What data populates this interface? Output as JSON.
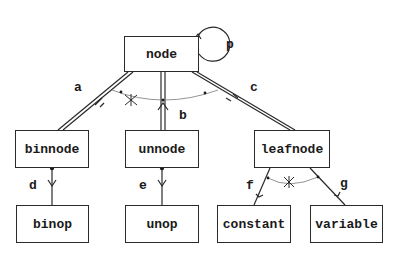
{
  "diagram": {
    "type": "entity-relationship / class hierarchy",
    "nodes": [
      {
        "id": "node",
        "label": "node"
      },
      {
        "id": "binnode",
        "label": "binnode"
      },
      {
        "id": "unnode",
        "label": "unnode"
      },
      {
        "id": "leafnode",
        "label": "leafnode"
      },
      {
        "id": "binop",
        "label": "binop"
      },
      {
        "id": "unop",
        "label": "unop"
      },
      {
        "id": "constant",
        "label": "constant"
      },
      {
        "id": "variable",
        "label": "variable"
      }
    ],
    "edges": [
      {
        "label": "a",
        "from": "node",
        "to": "binnode",
        "style": "double"
      },
      {
        "label": "b",
        "from": "node",
        "to": "unnode",
        "style": "double"
      },
      {
        "label": "c",
        "from": "node",
        "to": "leafnode",
        "style": "double"
      },
      {
        "label": "d",
        "from": "binnode",
        "to": "binop",
        "style": "single"
      },
      {
        "label": "e",
        "from": "unnode",
        "to": "unop",
        "style": "single"
      },
      {
        "label": "f",
        "from": "leafnode",
        "to": "constant",
        "style": "single"
      },
      {
        "label": "g",
        "from": "leafnode",
        "to": "variable",
        "style": "single"
      },
      {
        "label": "p",
        "from": "node",
        "to": "node",
        "style": "self-loop"
      }
    ],
    "exclusive_arcs": [
      {
        "edges": [
          "a",
          "b",
          "c"
        ],
        "marker": "asterisk"
      },
      {
        "edges": [
          "f",
          "g"
        ],
        "marker": "asterisk"
      }
    ]
  }
}
